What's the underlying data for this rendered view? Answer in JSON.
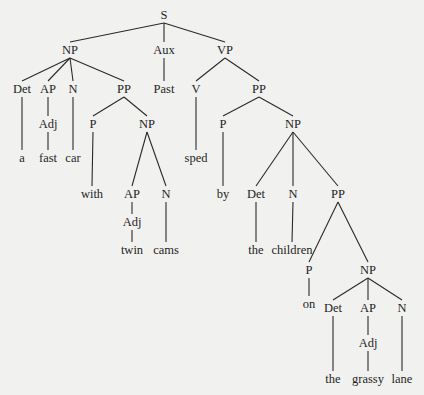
{
  "diagram": {
    "type": "syntax-tree",
    "sentence": "a fast car with twin cams sped by the children on the grassy lane",
    "nodes": [
      {
        "id": "s",
        "label": "S",
        "parent": null
      },
      {
        "id": "np1",
        "label": "NP",
        "parent": "s"
      },
      {
        "id": "aux",
        "label": "Aux",
        "parent": "s"
      },
      {
        "id": "vp",
        "label": "VP",
        "parent": "s"
      },
      {
        "id": "det1",
        "label": "Det",
        "parent": "np1"
      },
      {
        "id": "ap1",
        "label": "AP",
        "parent": "np1"
      },
      {
        "id": "n1",
        "label": "N",
        "parent": "np1"
      },
      {
        "id": "pp1",
        "label": "PP",
        "parent": "np1"
      },
      {
        "id": "past",
        "label": "Past",
        "parent": "aux"
      },
      {
        "id": "v",
        "label": "V",
        "parent": "vp"
      },
      {
        "id": "pp2",
        "label": "PP",
        "parent": "vp"
      },
      {
        "id": "w_a",
        "label": "a",
        "parent": "det1"
      },
      {
        "id": "adj1",
        "label": "Adj",
        "parent": "ap1"
      },
      {
        "id": "w_fast",
        "label": "fast",
        "parent": "adj1"
      },
      {
        "id": "w_car",
        "label": "car",
        "parent": "n1"
      },
      {
        "id": "p1",
        "label": "P",
        "parent": "pp1"
      },
      {
        "id": "np2",
        "label": "NP",
        "parent": "pp1"
      },
      {
        "id": "w_with",
        "label": "with",
        "parent": "p1"
      },
      {
        "id": "ap2",
        "label": "AP",
        "parent": "np2"
      },
      {
        "id": "n2",
        "label": "N",
        "parent": "np2"
      },
      {
        "id": "adj2",
        "label": "Adj",
        "parent": "ap2"
      },
      {
        "id": "w_twin",
        "label": "twin",
        "parent": "adj2"
      },
      {
        "id": "w_cams",
        "label": "cams",
        "parent": "n2"
      },
      {
        "id": "w_sped",
        "label": "sped",
        "parent": "v"
      },
      {
        "id": "p2",
        "label": "P",
        "parent": "pp2"
      },
      {
        "id": "np3",
        "label": "NP",
        "parent": "pp2"
      },
      {
        "id": "w_by",
        "label": "by",
        "parent": "p2"
      },
      {
        "id": "det2",
        "label": "Det",
        "parent": "np3"
      },
      {
        "id": "n3",
        "label": "N",
        "parent": "np3"
      },
      {
        "id": "pp3",
        "label": "PP",
        "parent": "np3"
      },
      {
        "id": "w_the1",
        "label": "the",
        "parent": "det2"
      },
      {
        "id": "w_children",
        "label": "children",
        "parent": "n3"
      },
      {
        "id": "p3",
        "label": "P",
        "parent": "pp3"
      },
      {
        "id": "np4",
        "label": "NP",
        "parent": "pp3"
      },
      {
        "id": "w_on",
        "label": "on",
        "parent": "p3"
      },
      {
        "id": "det3",
        "label": "Det",
        "parent": "np4"
      },
      {
        "id": "ap3",
        "label": "AP",
        "parent": "np4"
      },
      {
        "id": "n4",
        "label": "N",
        "parent": "np4"
      },
      {
        "id": "adj3",
        "label": "Adj",
        "parent": "ap3"
      },
      {
        "id": "w_the2",
        "label": "the",
        "parent": "det3"
      },
      {
        "id": "w_grassy",
        "label": "grassy",
        "parent": "adj3"
      },
      {
        "id": "w_lane",
        "label": "lane",
        "parent": "n4"
      }
    ]
  }
}
